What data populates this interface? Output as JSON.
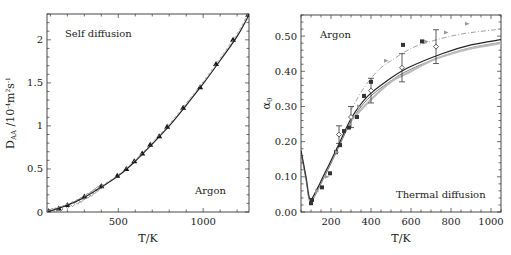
{
  "chart_data": [
    {
      "type": "scatter",
      "panel": "left",
      "title": "",
      "annotations": [
        "Self diffusion",
        "Argon"
      ],
      "xlabel": "T/K",
      "ylabel": "D_AA /10^-4 m^2 s^-1",
      "ylabel_main": "D",
      "ylabel_sub": "AA",
      "ylabel_rest": " /10",
      "ylabel_exp1": "-4",
      "ylabel_unit": "m",
      "ylabel_exp2": "2",
      "ylabel_unit2": "s",
      "ylabel_exp3": "-1",
      "xlim": [
        80,
        1270
      ],
      "ylim": [
        0,
        2.3
      ],
      "xticks": [
        500,
        1000
      ],
      "yticks": [
        0,
        0.5,
        1,
        1.5,
        2
      ],
      "ytick_labels": [
        "0",
        "0.5",
        "1",
        "1.5",
        "2"
      ],
      "grid": false,
      "series": [
        {
          "name": "simulation (triangles)",
          "marker": "triangle",
          "x": [
            90,
            150,
            200,
            300,
            400,
            494,
            547,
            594,
            641,
            688,
            741,
            788,
            882,
            982,
            1076,
            1176,
            1265
          ],
          "y": [
            0.01,
            0.04,
            0.08,
            0.18,
            0.3,
            0.42,
            0.5,
            0.59,
            0.68,
            0.78,
            0.88,
            0.99,
            1.21,
            1.45,
            1.72,
            2.0,
            2.29
          ]
        },
        {
          "name": "experimental (dense, grey)",
          "marker": "diamond",
          "x": [
            90,
            110,
            130,
            160,
            200,
            230,
            260,
            280,
            300,
            320,
            340,
            360,
            380,
            400
          ],
          "y": [
            0.01,
            0.015,
            0.02,
            0.035,
            0.07,
            0.09,
            0.12,
            0.14,
            0.17,
            0.19,
            0.21,
            0.24,
            0.27,
            0.3
          ]
        },
        {
          "name": "correlation (solid line)",
          "marker": "line",
          "x": [
            80,
            200,
            300,
            400,
            500,
            600,
            700,
            800,
            900,
            1000,
            1100,
            1200,
            1270
          ],
          "y": [
            0.0,
            0.08,
            0.17,
            0.29,
            0.42,
            0.59,
            0.79,
            1.0,
            1.24,
            1.49,
            1.76,
            2.04,
            2.29
          ]
        }
      ]
    },
    {
      "type": "scatter",
      "panel": "right",
      "title": "",
      "annotations": [
        "Argon",
        "Thermal diffusion"
      ],
      "xlabel": "T/K",
      "ylabel": "α_0",
      "ylabel_main": "α",
      "ylabel_sub": "0",
      "xlim": [
        50,
        1050
      ],
      "ylim": [
        0,
        0.56
      ],
      "xticks": [
        200,
        400,
        600,
        800,
        1000
      ],
      "yticks": [
        0.0,
        0.1,
        0.2,
        0.3,
        0.4,
        0.5
      ],
      "ytick_labels": [
        "0.00",
        "0.10",
        "0.20",
        "0.30",
        "0.40",
        "0.50"
      ],
      "grid": false,
      "series": [
        {
          "name": "solid line",
          "marker": "line",
          "x": [
            50,
            75,
            95,
            130,
            160,
            195,
            245,
            305,
            385,
            485,
            585,
            755,
            900,
            1050
          ],
          "y": [
            0.175,
            0.1,
            0.037,
            0.065,
            0.1,
            0.14,
            0.2,
            0.27,
            0.33,
            0.375,
            0.41,
            0.45,
            0.475,
            0.49
          ]
        },
        {
          "name": "dash-dot line",
          "marker": "dashdot",
          "x": [
            300,
            350,
            400,
            450,
            500,
            600,
            700,
            800,
            900,
            1050
          ],
          "y": [
            0.29,
            0.34,
            0.38,
            0.41,
            0.43,
            0.465,
            0.485,
            0.5,
            0.51,
            0.52
          ]
        },
        {
          "name": "grey band lines",
          "marker": "greyline",
          "x": [
            300,
            400,
            500,
            600,
            700,
            800,
            900,
            1050
          ],
          "y": [
            0.26,
            0.32,
            0.37,
            0.4,
            0.43,
            0.45,
            0.465,
            0.48
          ]
        },
        {
          "name": "squares",
          "marker": "square",
          "x": [
            100,
            105,
            155,
            195,
            225,
            245,
            265,
            290,
            330,
            365,
            400,
            560,
            655
          ],
          "y": [
            0.025,
            0.034,
            0.07,
            0.11,
            0.17,
            0.19,
            0.23,
            0.24,
            0.27,
            0.33,
            0.37,
            0.475,
            0.485
          ]
        },
        {
          "name": "diamonds with error bars",
          "marker": "diamond_err",
          "x": [
            240,
            300,
            400,
            555,
            725
          ],
          "y": [
            0.22,
            0.27,
            0.345,
            0.41,
            0.47
          ],
          "err": [
            0.025,
            0.03,
            0.035,
            0.04,
            0.048
          ]
        },
        {
          "name": "triangles",
          "marker": "triangle_right",
          "x": [
            130,
            180,
            230,
            340,
            475,
            675,
            775,
            880
          ],
          "y": [
            0.06,
            0.1,
            0.17,
            0.3,
            0.43,
            0.485,
            0.51,
            0.535
          ]
        }
      ]
    }
  ]
}
